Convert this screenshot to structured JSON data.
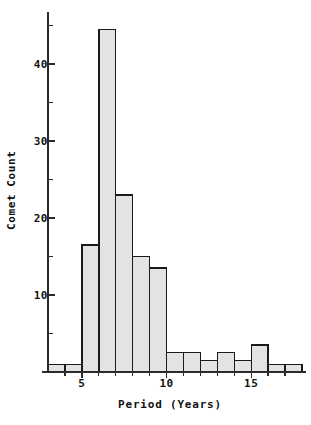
{
  "chart_data": {
    "type": "bar",
    "title": "",
    "subtitle": "",
    "xlabel": "Period (Years)",
    "ylabel": "Comet Count",
    "bin_width": 1,
    "bin_edges": [
      3,
      4,
      5,
      6,
      7,
      8,
      9,
      10,
      11,
      12,
      13,
      14,
      15,
      16,
      17,
      18
    ],
    "categories": [
      "3-4",
      "4-5",
      "5-6",
      "6-7",
      "7-8",
      "8-9",
      "9-10",
      "10-11",
      "11-12",
      "12-13",
      "13-14",
      "14-15",
      "15-16",
      "16-17",
      "17-18"
    ],
    "x": [
      3.5,
      4.5,
      5.5,
      6.5,
      7.5,
      8.5,
      9.5,
      10.5,
      11.5,
      12.5,
      13.5,
      14.5,
      15.5,
      16.5,
      17.5
    ],
    "values": [
      1,
      1,
      16.5,
      44.5,
      23,
      15,
      13.5,
      2.5,
      2.5,
      1.5,
      2.5,
      1.5,
      3.5,
      1,
      1
    ],
    "xlim": [
      3,
      18
    ],
    "ylim": [
      0,
      46.5
    ],
    "x_major_ticks": [
      5,
      10,
      15
    ],
    "x_major_tick_labels": [
      "5",
      "10",
      "15"
    ],
    "x_minor_ticks": [
      4,
      6,
      7,
      8,
      9,
      11,
      12,
      13,
      14,
      16,
      17
    ],
    "y_major_ticks": [
      10,
      20,
      30,
      40
    ],
    "y_major_tick_labels": [
      "10",
      "20",
      "30",
      "40"
    ],
    "y_minor_ticks": [
      5,
      15,
      25,
      35,
      45
    ],
    "grid": false,
    "legend": null,
    "bar_fill_color": "#e3e3e3",
    "bar_edge_color": "#1a1a1a",
    "axis_color": "#2b2b2b",
    "text_color": "#111111",
    "background_color": "#ffffff"
  }
}
